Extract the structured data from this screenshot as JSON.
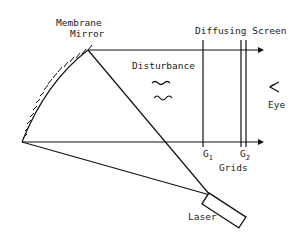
{
  "diagram": {
    "colors": {
      "line": "#111111",
      "text": "#222222",
      "background": "#ffffff"
    },
    "labels": {
      "mirror_line1": "Membrane",
      "mirror_line2": "Mirror",
      "screen": "Diffusing Screen",
      "disturbance": "Disturbance",
      "eye": "Eye",
      "g1": "G",
      "g1_sub": "1",
      "g2": "G",
      "g2_sub": "2",
      "grids": "Grids",
      "laser": "Laser"
    },
    "icons": {
      "eye": "eye-icon",
      "disturbance": "wave-icon"
    }
  }
}
